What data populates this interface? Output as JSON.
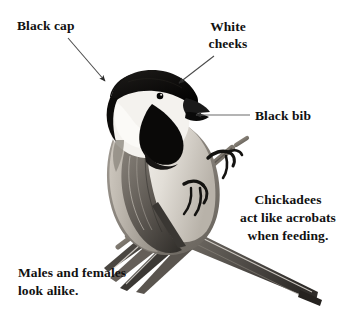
{
  "page": {
    "background_color": "#ffffff",
    "text_color": "#111111",
    "width": 350,
    "height": 318
  },
  "illustration": {
    "subject": "black-capped chickadee perched on a twig",
    "style": "grayscale engraving / halftone photograph",
    "colors": {
      "cap_and_bib": "#0d0d0d",
      "cheek": "#f2f0ec",
      "breast": "#d9d5cf",
      "flank": "#b0aaa2",
      "wing": "#6f6a64",
      "wing_dark": "#3c3935",
      "tail": "#55514c",
      "branch": "#8a847b",
      "beak": "#1a1a1a",
      "eye": "#0a0a0a"
    }
  },
  "labels": [
    {
      "id": "black-cap",
      "text": "Black cap",
      "points_to": "crown of head",
      "arrow": {
        "from": [
          68,
          38
        ],
        "to": [
          107,
          83
        ],
        "style": "thin-line-with-arrowhead"
      }
    },
    {
      "id": "white-cheeks",
      "text": "White\ncheeks",
      "points_to": "white cheek patch",
      "arrow": {
        "from": [
          214,
          56
        ],
        "to": [
          176,
          84
        ],
        "style": "thin-line-with-arrowhead"
      }
    },
    {
      "id": "black-bib",
      "text": "Black bib",
      "points_to": "black throat bib",
      "arrow": {
        "from": [
          250,
          115
        ],
        "to": [
          194,
          115
        ],
        "style": "thin-line-with-arrowhead"
      }
    }
  ],
  "notes": [
    {
      "id": "acrobats",
      "text": "Chickadees\nact like acrobats\nwhen feeding.",
      "align": "center"
    },
    {
      "id": "males-females",
      "text": "Males and females\nlook alike.",
      "align": "left"
    }
  ]
}
